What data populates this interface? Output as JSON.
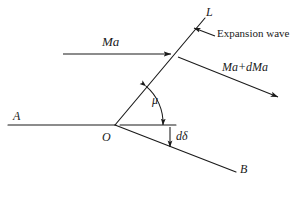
{
  "figure": {
    "kind": "schematic-diagram",
    "title_visible": false,
    "background_color": "#ffffff",
    "stroke_color": "#1a1a1a",
    "width": 305,
    "height": 199
  },
  "labels": {
    "wave_line": "L",
    "incoming_mach": "Ma",
    "expansion_wave": "Expansion wave",
    "outgoing_mach": "Ma+dMa",
    "mach_angle": "μ",
    "upstream_wall": "A",
    "vertex": "O",
    "deflection_angle": "dδ",
    "downstream_wall": "B"
  },
  "elements": {
    "line_L": {
      "name": "expansion-wave-line",
      "from": [
        115,
        125
      ],
      "to": [
        205,
        18
      ],
      "style": "solid"
    },
    "line_A": {
      "name": "upstream-wall-line",
      "from": [
        8,
        125
      ],
      "to": [
        115,
        125
      ],
      "style": "solid"
    },
    "line_B": {
      "name": "downstream-wall-line",
      "from": [
        115,
        125
      ],
      "to": [
        236,
        172
      ],
      "style": "solid"
    },
    "reference_horizontal": {
      "name": "horizontal-reference-line",
      "from": [
        118,
        125
      ],
      "to": [
        176,
        125
      ],
      "style": "solid"
    },
    "arrow_incoming": {
      "name": "incoming-flow-arrow",
      "from": [
        63,
        54
      ],
      "to": [
        174,
        54
      ],
      "arrowhead": "end"
    },
    "arrow_outgoing": {
      "name": "outgoing-flow-arrow",
      "from": [
        176,
        56
      ],
      "to": [
        281,
        98
      ],
      "arrowhead": "end"
    },
    "arrow_expansion_pointer": {
      "name": "expansion-wave-pointer-arrow",
      "from": [
        214,
        36
      ],
      "to": [
        191,
        27
      ],
      "arrowhead": "end"
    },
    "arc_mu": {
      "name": "mach-angle-arc",
      "center": [
        115,
        125
      ],
      "radius": 48,
      "from_deg": -50,
      "to_deg": 0,
      "arrowhead": "both"
    },
    "arrow_ddelta": {
      "name": "deflection-angle-arrow",
      "from": [
        170,
        126
      ],
      "to": [
        170,
        150
      ],
      "arrowhead": "end"
    }
  },
  "colors": {
    "ink": "#1a1a1a",
    "paper": "#ffffff"
  }
}
